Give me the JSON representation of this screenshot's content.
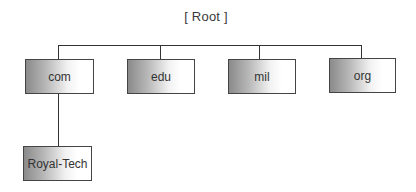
{
  "diagram": {
    "type": "tree",
    "root": {
      "label": "[ Root ]"
    },
    "top_level_domains": [
      {
        "label": "com"
      },
      {
        "label": "edu"
      },
      {
        "label": "mil"
      },
      {
        "label": "org"
      }
    ],
    "children": {
      "com": [
        {
          "label": "Royal-Tech"
        }
      ]
    },
    "colors": {
      "line": "#333333",
      "box_border": "#444444",
      "gradient_dark": "#8a8a8a",
      "gradient_light": "#ffffff"
    }
  }
}
